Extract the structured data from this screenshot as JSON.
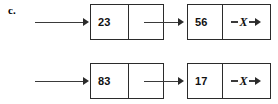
{
  "figure": {
    "part_label": "c.",
    "colors": {
      "background": "#ffffff",
      "box_border": "#2b2b2b",
      "arrow": "#3a3a3a",
      "text": "#111111"
    },
    "null_marker": {
      "symbol": "X",
      "dash": "-",
      "arrow_icon": "arrow-right-icon"
    },
    "lists": [
      {
        "name": "list-1",
        "head_arrow": "arrow-right-icon",
        "nodes": [
          {
            "data": "23",
            "pointer": "link"
          },
          {
            "data": "56",
            "pointer": "null"
          }
        ]
      },
      {
        "name": "list-2",
        "head_arrow": "arrow-right-icon",
        "nodes": [
          {
            "data": "83",
            "pointer": "link"
          },
          {
            "data": "17",
            "pointer": "null"
          }
        ]
      }
    ]
  }
}
